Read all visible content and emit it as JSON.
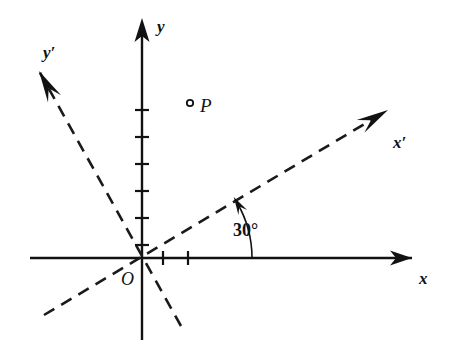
{
  "figure": {
    "background_color": "#ffffff",
    "ink_color": "#121212"
  },
  "labels": {
    "x_axis": "x",
    "y_axis": "y",
    "x_prime_axis": "x′",
    "y_prime_axis": "y′",
    "origin": "O",
    "point": "P",
    "angle": "30°"
  },
  "geometry": {
    "origin": {
      "x": 142,
      "y": 258
    },
    "x_axis": {
      "x1": 30,
      "y1": 258,
      "x2": 412,
      "y2": 258,
      "arrow_at": "end"
    },
    "y_axis": {
      "x1": 142,
      "y1": 340,
      "x2": 142,
      "y2": 26,
      "arrow_at": "end"
    },
    "x_prime_axis": {
      "rotation_deg": 30,
      "tail": {
        "x": 44,
        "y": 315
      },
      "head": {
        "x": 388,
        "y": 110
      },
      "arrow_at": "end",
      "style": "dashed"
    },
    "y_prime_axis": {
      "rotation_deg": 120,
      "tail": {
        "x": 181,
        "y": 326
      },
      "head": {
        "x": 39,
        "y": 71
      },
      "arrow_at": "end",
      "style": "dashed"
    },
    "point_P": {
      "x": 190,
      "y": 103,
      "marker": "open-circle",
      "radius": 3.2
    },
    "angle_arc": {
      "center": {
        "x": 142,
        "y": 258
      },
      "radius": 110,
      "start_deg": 0,
      "end_deg": 30,
      "arrow_at": "end"
    },
    "y_axis_ticks": [
      110,
      137,
      164,
      191,
      218,
      245
    ],
    "y_tick_half_width": 7,
    "x_axis_ticks": [
      163,
      188
    ],
    "x_tick_half_height": 7
  },
  "label_positions": {
    "x_axis": {
      "x": 419,
      "y": 284
    },
    "y_axis": {
      "x": 157,
      "y": 32
    },
    "x_prime_axis": {
      "x": 393,
      "y": 148
    },
    "y_prime_axis": {
      "x": 43,
      "y": 58
    },
    "origin": {
      "x": 121,
      "y": 285
    },
    "point": {
      "x": 200,
      "y": 112
    },
    "angle": {
      "x": 233,
      "y": 236
    }
  }
}
